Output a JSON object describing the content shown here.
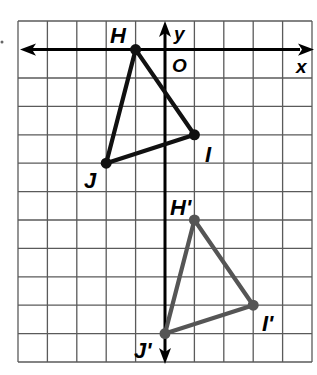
{
  "diagram": {
    "type": "coordinate-grid-transformation",
    "grid": {
      "columns": 10,
      "rows": 12,
      "x_range": [
        -5,
        5
      ],
      "y_range": [
        -11,
        1
      ]
    },
    "axes": {
      "x_label": "x",
      "y_label": "y",
      "origin_label": "O"
    },
    "colors": {
      "original": "#111111",
      "image": "#555555",
      "grid": "#5a5a5a",
      "axis": "#000000"
    },
    "original_triangle": {
      "points": [
        {
          "label": "H",
          "x": -1,
          "y": 0
        },
        {
          "label": "I",
          "x": 1,
          "y": -3
        },
        {
          "label": "J",
          "x": -2,
          "y": -4
        }
      ]
    },
    "image_triangle": {
      "points": [
        {
          "label": "H'",
          "x": 1,
          "y": -6
        },
        {
          "label": "I'",
          "x": 3,
          "y": -9
        },
        {
          "label": "J'",
          "x": 0,
          "y": -10
        }
      ]
    }
  }
}
